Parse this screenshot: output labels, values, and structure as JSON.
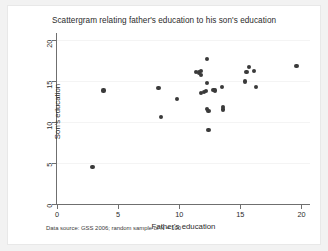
{
  "chart_data": {
    "type": "scatter",
    "title": "Scattergram relating father's education to his son's education",
    "xlabel": "Father's education",
    "ylabel": "Son's education",
    "note": "Data source: GSS 2006; random sample of N = 100",
    "xlim": [
      0,
      20.7
    ],
    "ylim": [
      0,
      20.8
    ],
    "xticks": [
      0,
      5,
      10,
      15,
      20
    ],
    "yticks": [
      0,
      5,
      10,
      15,
      20
    ],
    "xticklabels": [
      "0",
      "5",
      "10",
      "15",
      "20"
    ],
    "yticklabels": [
      "0",
      "5",
      "10",
      "15",
      "20"
    ],
    "grid": "horizontal",
    "legend": "none",
    "marker": {
      "shape": "circle",
      "color": "#3a3a3a",
      "size": 4.2
    },
    "points": [
      {
        "x": 2.9,
        "y": 4.5
      },
      {
        "x": 3.8,
        "y": 13.8
      },
      {
        "x": 8.3,
        "y": 14.1
      },
      {
        "x": 8.5,
        "y": 10.6
      },
      {
        "x": 9.8,
        "y": 12.8
      },
      {
        "x": 11.4,
        "y": 16.1
      },
      {
        "x": 11.6,
        "y": 16.0
      },
      {
        "x": 11.8,
        "y": 16.2
      },
      {
        "x": 11.8,
        "y": 15.7
      },
      {
        "x": 11.8,
        "y": 13.5
      },
      {
        "x": 12.0,
        "y": 13.6
      },
      {
        "x": 12.2,
        "y": 13.7
      },
      {
        "x": 12.3,
        "y": 17.6
      },
      {
        "x": 12.3,
        "y": 14.7
      },
      {
        "x": 12.3,
        "y": 11.6
      },
      {
        "x": 12.4,
        "y": 11.3
      },
      {
        "x": 12.4,
        "y": 9.0
      },
      {
        "x": 12.8,
        "y": 13.9
      },
      {
        "x": 12.9,
        "y": 13.8
      },
      {
        "x": 13.5,
        "y": 14.2
      },
      {
        "x": 13.6,
        "y": 11.8
      },
      {
        "x": 13.6,
        "y": 11.5
      },
      {
        "x": 15.4,
        "y": 14.9
      },
      {
        "x": 15.5,
        "y": 16.1
      },
      {
        "x": 15.7,
        "y": 16.7
      },
      {
        "x": 16.1,
        "y": 16.2
      },
      {
        "x": 16.3,
        "y": 14.2
      },
      {
        "x": 19.6,
        "y": 16.8
      }
    ]
  }
}
